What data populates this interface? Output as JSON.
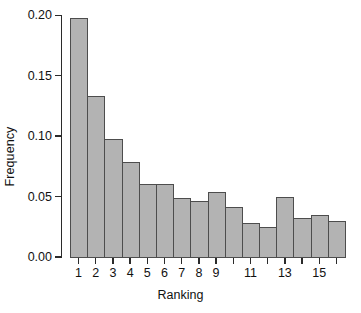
{
  "chart_data": {
    "type": "bar",
    "title": "",
    "subtitle": "",
    "xlabel": "Ranking",
    "ylabel": "Frequency",
    "categories": [
      "1",
      "2",
      "3",
      "4",
      "5",
      "6",
      "7",
      "8",
      "9",
      "10",
      "11",
      "12",
      "13",
      "14",
      "15",
      "16"
    ],
    "values": [
      0.198,
      0.133,
      0.098,
      0.079,
      0.06,
      0.06,
      0.049,
      0.046,
      0.054,
      0.041,
      0.028,
      0.025,
      0.05,
      0.032,
      0.035,
      0.03
    ],
    "xlim": [
      0.5,
      16.5
    ],
    "ylim": [
      0.0,
      0.2
    ],
    "y_ticks": [
      0.0,
      0.05,
      0.1,
      0.15,
      0.2
    ],
    "y_tick_labels": [
      "0.00",
      "0.05",
      "0.10",
      "0.15",
      "0.20"
    ],
    "x_ticks": [
      1,
      2,
      3,
      4,
      5,
      6,
      7,
      8,
      9,
      10,
      11,
      12,
      13,
      14,
      15,
      16
    ],
    "x_tick_labels": [
      "1",
      "2",
      "3",
      "4",
      "5",
      "6",
      "7",
      "8",
      "9",
      "",
      "11",
      "",
      "13",
      "",
      "15",
      ""
    ],
    "grid": false,
    "legend": null,
    "bar_fill_color": "#b3b3b3",
    "bar_edge_color": "#4d4d4d",
    "axis_color": "#2b2b2b",
    "background_color": "#ffffff"
  }
}
